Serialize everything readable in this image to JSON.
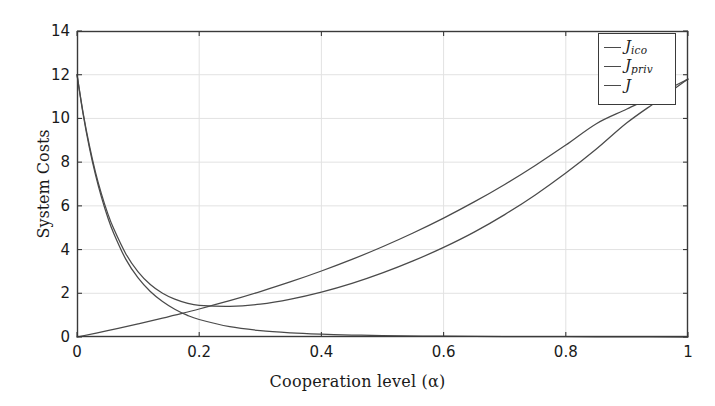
{
  "chart_data": {
    "type": "line",
    "title": "",
    "xlabel": "Cooperation level (α)",
    "ylabel": "System Costs",
    "xlim": [
      0,
      1
    ],
    "ylim": [
      0,
      14
    ],
    "xticks": [
      "0",
      "0.2",
      "0.4",
      "0.6",
      "0.8",
      "1"
    ],
    "xtick_values": [
      0,
      0.2,
      0.4,
      0.6,
      0.8,
      1
    ],
    "yticks": [
      "0",
      "2",
      "4",
      "6",
      "8",
      "10",
      "12",
      "14"
    ],
    "ytick_values": [
      0,
      2,
      4,
      6,
      8,
      10,
      12,
      14
    ],
    "grid": true,
    "legend_position": "upper right",
    "line_color": "#4a4a4a",
    "grid_color": "#e2e2e2",
    "axis_color": "#3a3a3a",
    "series": [
      {
        "name": "J_ico",
        "label_main": "J",
        "label_sub": "ico",
        "x": [
          0,
          0.01,
          0.02,
          0.03,
          0.04,
          0.05,
          0.06,
          0.08,
          0.1,
          0.12,
          0.14,
          0.16,
          0.18,
          0.2,
          0.25,
          0.3,
          0.35,
          0.4,
          0.45,
          0.5,
          0.6,
          0.7,
          0.8,
          0.9,
          1.0
        ],
        "values": [
          12.0,
          10.2,
          8.7,
          7.45,
          6.4,
          5.5,
          4.75,
          3.55,
          2.7,
          2.08,
          1.62,
          1.27,
          1.0,
          0.8,
          0.47,
          0.29,
          0.19,
          0.13,
          0.09,
          0.065,
          0.035,
          0.02,
          0.012,
          0.006,
          0.0
        ]
      },
      {
        "name": "J_priv",
        "label_main": "J",
        "label_sub": "priv",
        "x": [
          0,
          0.05,
          0.1,
          0.14,
          0.16,
          0.2,
          0.25,
          0.3,
          0.35,
          0.4,
          0.45,
          0.5,
          0.55,
          0.6,
          0.65,
          0.7,
          0.75,
          0.8,
          0.85,
          0.9,
          0.95,
          1.0
        ],
        "values": [
          0.0,
          0.29,
          0.6,
          0.86,
          1.0,
          1.28,
          1.66,
          2.08,
          2.53,
          3.02,
          3.55,
          4.13,
          4.76,
          5.44,
          6.18,
          6.98,
          7.85,
          8.78,
          9.76,
          10.43,
          11.1,
          11.8
        ]
      },
      {
        "name": "J",
        "label_main": "J",
        "label_sub": "",
        "x": [
          0,
          0.01,
          0.02,
          0.03,
          0.04,
          0.05,
          0.06,
          0.08,
          0.1,
          0.12,
          0.14,
          0.16,
          0.18,
          0.2,
          0.25,
          0.3,
          0.35,
          0.4,
          0.45,
          0.5,
          0.55,
          0.6,
          0.65,
          0.7,
          0.75,
          0.8,
          0.85,
          0.9,
          0.95,
          1.0
        ],
        "values": [
          12.0,
          10.26,
          8.8,
          7.57,
          6.55,
          5.68,
          4.96,
          3.8,
          2.98,
          2.4,
          2.0,
          1.73,
          1.55,
          1.45,
          1.4,
          1.5,
          1.73,
          2.05,
          2.45,
          2.93,
          3.48,
          4.1,
          4.8,
          5.6,
          6.5,
          7.5,
          8.6,
          9.8,
          10.8,
          11.8
        ]
      }
    ]
  },
  "plot_area": {
    "left": 77,
    "top": 31,
    "right": 688,
    "bottom": 337
  },
  "legend": {
    "left": 598,
    "top": 33,
    "width": 78,
    "height": 72
  }
}
